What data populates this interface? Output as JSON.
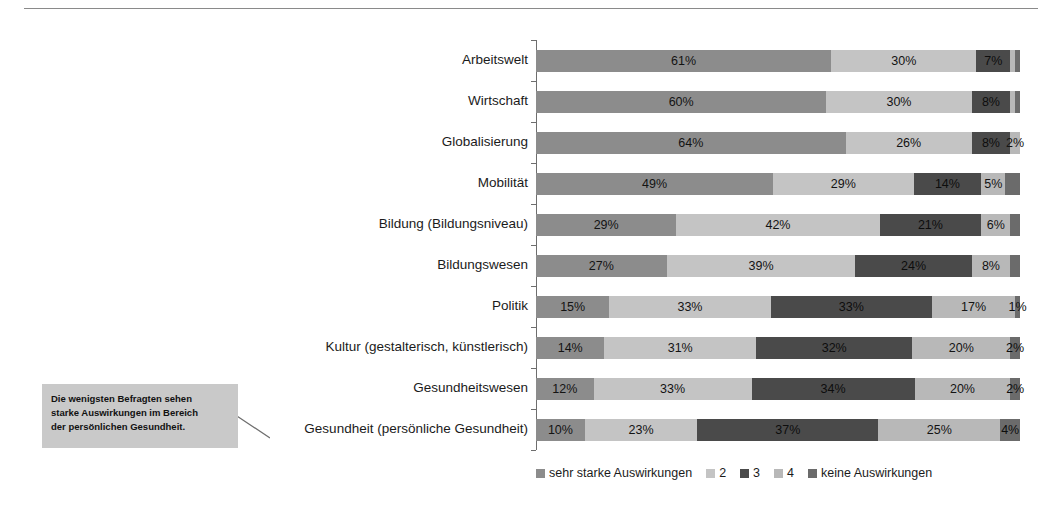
{
  "chart_data": {
    "type": "bar",
    "subtype": "stacked-horizontal-100",
    "title": "",
    "xlabel": "",
    "ylabel": "",
    "xlim": [
      0,
      100
    ],
    "grid": false,
    "legend_position": "bottom-right",
    "categories": [
      "Arbeitswelt",
      "Wirtschaft",
      "Globalisierung",
      "Mobilität",
      "Bildung (Bildungsniveau)",
      "Bildungswesen",
      "Politik",
      "Kultur (gestalterisch, künstlerisch)",
      "Gesundheitswesen",
      "Gesundheit (persönliche Gesundheit)"
    ],
    "series": [
      {
        "name": "sehr starke Auswirkungen",
        "color": "#8c8c8c",
        "values": [
          61,
          60,
          64,
          49,
          29,
          27,
          15,
          14,
          12,
          10
        ],
        "labels": [
          "61%",
          "60%",
          "64%",
          "49%",
          "29%",
          "27%",
          "15%",
          "14%",
          "12%",
          "10%"
        ]
      },
      {
        "name": "2",
        "color": "#c4c4c4",
        "values": [
          30,
          30,
          26,
          29,
          42,
          39,
          33,
          31,
          33,
          23
        ],
        "labels": [
          "30%",
          "30%",
          "26%",
          "29%",
          "42%",
          "39%",
          "33%",
          "31%",
          "33%",
          "23%"
        ]
      },
      {
        "name": "3",
        "color": "#4a4a4a",
        "values": [
          7,
          8,
          8,
          14,
          21,
          24,
          33,
          32,
          34,
          37
        ],
        "labels": [
          "7%",
          "8%",
          "8%",
          "14%",
          "21%",
          "24%",
          "33%",
          "32%",
          "34%",
          "37%"
        ]
      },
      {
        "name": "4",
        "color": "#b8b8b8",
        "values": [
          1,
          1,
          2,
          5,
          6,
          8,
          17,
          20,
          20,
          25
        ],
        "labels": [
          "",
          "",
          "2%",
          "5%",
          "6%",
          "8%",
          "17%",
          "20%",
          "20%",
          "25%"
        ]
      },
      {
        "name": "keine Auswirkungen",
        "color": "#6b6b6b",
        "values": [
          1,
          1,
          0,
          3,
          2,
          2,
          1,
          2,
          2,
          4
        ],
        "labels": [
          "",
          "",
          "",
          "",
          "",
          "",
          "1%",
          "2%",
          "2%",
          "4%"
        ]
      }
    ]
  },
  "callout": {
    "line1": "Die wenigsten Befragten sehen",
    "line2": "starke Auswirkungen im Bereich",
    "line3": "der persönlichen Gesundheit."
  },
  "legend": {
    "items": [
      {
        "label": "sehr starke Auswirkungen",
        "color": "#8c8c8c"
      },
      {
        "label": "2",
        "color": "#c4c4c4"
      },
      {
        "label": "3",
        "color": "#4a4a4a"
      },
      {
        "label": "4",
        "color": "#b8b8b8"
      },
      {
        "label": "keine Auswirkungen",
        "color": "#6b6b6b"
      }
    ]
  },
  "colors": {
    "axis": "#6e6e6e",
    "rule": "#8a8a8a",
    "callout_bg": "#c9c9c9",
    "text": "#1b1b1b"
  }
}
